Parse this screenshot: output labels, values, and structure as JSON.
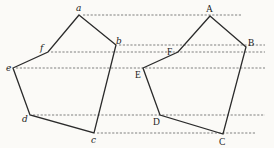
{
  "diagram": {
    "type": "geometric-projection",
    "colors": {
      "edge": "#2b2b2b",
      "dash": "#4a4a4a",
      "background": "#fbfaf7"
    },
    "left_figure": {
      "vertices": [
        {
          "label": "a",
          "x": 79,
          "y": 15
        },
        {
          "label": "b",
          "x": 116,
          "y": 45
        },
        {
          "label": "c",
          "x": 94,
          "y": 133
        },
        {
          "label": "d",
          "x": 30,
          "y": 115
        },
        {
          "label": "e",
          "x": 13,
          "y": 68
        },
        {
          "label": "f",
          "x": 48,
          "y": 52
        }
      ]
    },
    "right_figure": {
      "vertices": [
        {
          "label": "A",
          "x": 210,
          "y": 16
        },
        {
          "label": "B",
          "x": 246,
          "y": 47
        },
        {
          "label": "C",
          "x": 223,
          "y": 134
        },
        {
          "label": "D",
          "x": 160,
          "y": 115
        },
        {
          "label": "E",
          "x": 143,
          "y": 68
        },
        {
          "label": "F",
          "x": 178,
          "y": 52
        }
      ]
    },
    "projection_lines": [
      {
        "from": "a",
        "y": 15,
        "x1": 83,
        "x2": 242
      },
      {
        "from": "b",
        "y": 45,
        "x1": 119,
        "x2": 265
      },
      {
        "from": "f",
        "y": 52,
        "x1": 51,
        "x2": 265
      },
      {
        "from": "e",
        "y": 68,
        "x1": 16,
        "x2": 265
      },
      {
        "from": "d",
        "y": 115,
        "x1": 33,
        "x2": 265
      },
      {
        "from": "c",
        "y": 133,
        "x1": 97,
        "x2": 255
      }
    ]
  }
}
